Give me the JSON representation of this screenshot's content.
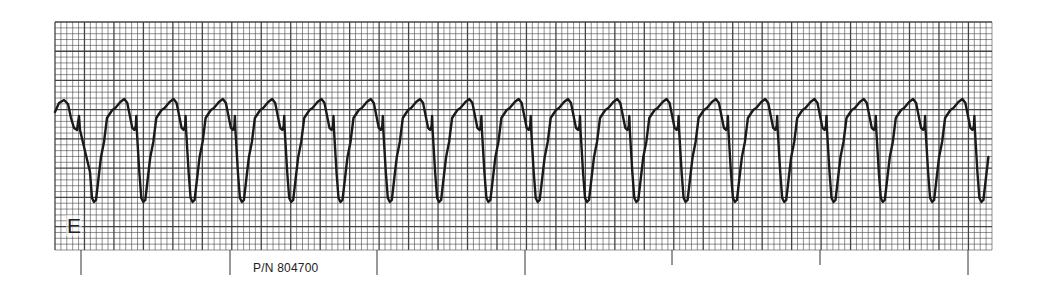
{
  "chart_data": {
    "type": "line",
    "title": "",
    "subtitle": "ECG rhythm strip",
    "xlabel": "",
    "ylabel": "",
    "grid": true,
    "legend": null,
    "lead_label": "E",
    "part_number": "P/N 804700",
    "paper": {
      "x": 55,
      "y": 22,
      "width": 937,
      "height": 228,
      "small_box_px": 5.9,
      "major_every": 5,
      "grid_color": "#3a3a3a",
      "background": "#ffffff"
    },
    "time_marks_x": [
      81,
      230,
      377,
      525,
      672,
      820,
      968
    ],
    "time_marks_long": [
      true,
      true,
      true,
      true,
      false,
      false,
      true
    ],
    "rhythm": {
      "beats_visible": 19,
      "beat_period_px": 49.3,
      "first_trough_x": 88,
      "peak_y": 100,
      "notch_y": 130,
      "trough_y": 202,
      "description": "Wide-complex regular tachycardia, monomorphic, deep negative deflections"
    },
    "trace_color": "#1a1a1a"
  }
}
